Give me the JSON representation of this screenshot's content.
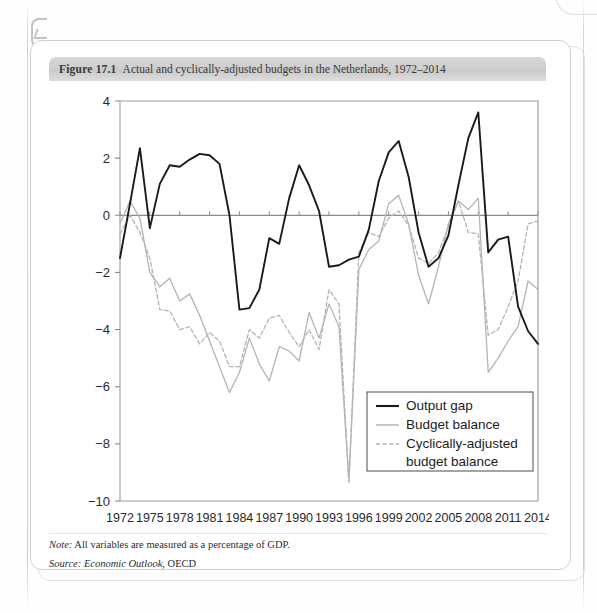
{
  "figure": {
    "number": "Figure 17.1",
    "title": "Actual and cyclically-adjusted budgets in the Netherlands, 1972–2014",
    "note_label": "Note:",
    "note_text": " All variables are measured as a percentage of GDP.",
    "source_label": "Source:",
    "source_title": " Economic Outlook",
    "source_rest": ", OECD"
  },
  "colors": {
    "output_gap": "#1a1a1a",
    "budget_balance": "#b4b4b4",
    "cyclically_adjusted": "#b4b4b4",
    "axis": "#8a8a8a",
    "frame": "#9a9a9a",
    "header_bg": "#d2d2d2",
    "card_border": "#cfcfcf"
  },
  "legend": {
    "position": "bottom-right",
    "entries": [
      {
        "label": "Output gap",
        "style": "solid",
        "color": "#1a1a1a"
      },
      {
        "label": "Budget balance",
        "style": "solid",
        "color": "#b4b4b4"
      },
      {
        "label": "Cyclically-adjusted",
        "label2": "budget balance",
        "style": "dashed",
        "color": "#b4b4b4"
      }
    ]
  },
  "chart_data": {
    "type": "line",
    "title": "Actual and cyclically-adjusted budgets in the Netherlands, 1972–2014",
    "xlabel": "",
    "ylabel": "",
    "xlim": [
      1972,
      2014
    ],
    "ylim": [
      -10,
      4
    ],
    "ytick_step": 2,
    "xtick_step": 3,
    "grid": false,
    "zero_line": true,
    "yticks": [
      4,
      2,
      0,
      -2,
      -4,
      -6,
      -8,
      -10
    ],
    "xticks": [
      1972,
      1975,
      1978,
      1981,
      1984,
      1987,
      1990,
      1993,
      1996,
      1999,
      2002,
      2005,
      2008,
      2011,
      2014
    ],
    "x": [
      1972,
      1973,
      1974,
      1975,
      1976,
      1977,
      1978,
      1979,
      1980,
      1981,
      1982,
      1983,
      1984,
      1985,
      1986,
      1987,
      1988,
      1989,
      1990,
      1991,
      1992,
      1993,
      1994,
      1995,
      1996,
      1997,
      1998,
      1999,
      2000,
      2001,
      2002,
      2003,
      2004,
      2005,
      2006,
      2007,
      2008,
      2009,
      2010,
      2011,
      2012,
      2013,
      2014
    ],
    "series": [
      {
        "name": "Output gap",
        "style": "solid",
        "color": "#1a1a1a",
        "values": [
          -1.5,
          0.4,
          2.35,
          -0.45,
          1.1,
          1.75,
          1.7,
          1.95,
          2.15,
          2.1,
          1.8,
          0.0,
          -3.3,
          -3.25,
          -2.6,
          -0.8,
          -1.0,
          0.6,
          1.75,
          1.05,
          0.15,
          -1.8,
          -1.75,
          -1.55,
          -1.45,
          -0.5,
          1.2,
          2.2,
          2.6,
          1.35,
          -0.6,
          -1.8,
          -1.5,
          -0.7,
          1.05,
          2.7,
          3.6,
          -1.3,
          -0.85,
          -0.75,
          -3.2,
          -4.05,
          -4.5
        ]
      },
      {
        "name": "Budget balance",
        "style": "solid",
        "color": "#b4b4b4",
        "values": [
          -0.3,
          0.5,
          -0.1,
          -2.0,
          -2.5,
          -2.2,
          -3.0,
          -2.75,
          -3.5,
          -4.4,
          -5.3,
          -6.2,
          -5.5,
          -4.3,
          -5.2,
          -5.8,
          -4.6,
          -4.75,
          -5.1,
          -3.4,
          -4.3,
          -3.1,
          -3.9,
          -9.3,
          -1.9,
          -1.2,
          -0.9,
          0.4,
          0.7,
          -0.3,
          -2.1,
          -3.1,
          -1.8,
          -0.3,
          0.5,
          0.2,
          0.6,
          -5.5,
          -5.0,
          -4.4,
          -3.9,
          -2.3,
          -2.6
        ]
      },
      {
        "name": "Cyclically-adjusted budget balance",
        "style": "dashed",
        "color": "#b4b4b4",
        "values": [
          -0.65,
          0.0,
          -0.6,
          -1.5,
          -3.3,
          -3.35,
          -4.0,
          -3.9,
          -4.5,
          -4.1,
          -4.4,
          -5.3,
          -5.3,
          -4.0,
          -4.3,
          -3.6,
          -3.5,
          -4.1,
          -4.6,
          -4.0,
          -4.7,
          -2.6,
          -3.1,
          -9.35,
          -1.3,
          -0.6,
          -0.75,
          -0.1,
          0.15,
          -0.35,
          -1.5,
          -1.7,
          -1.3,
          -0.4,
          0.5,
          -0.6,
          -0.65,
          -4.2,
          -4.0,
          -3.2,
          -2.3,
          -0.3,
          -0.2
        ]
      }
    ]
  }
}
